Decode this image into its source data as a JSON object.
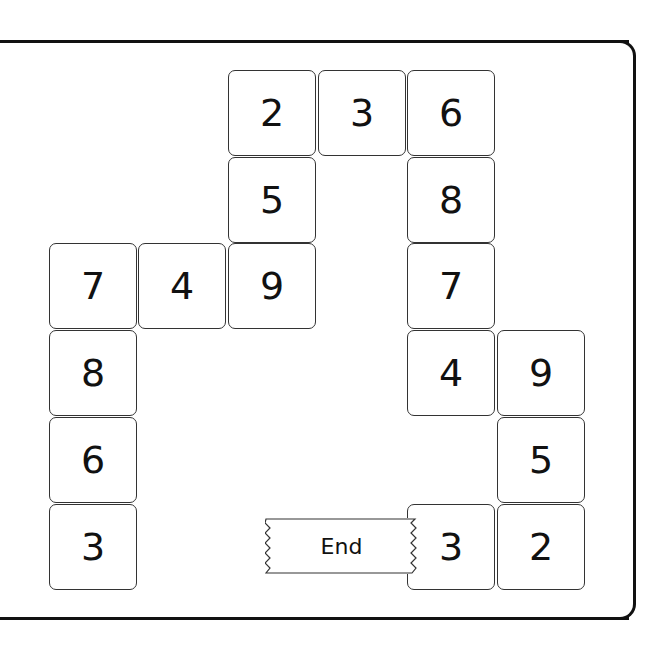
{
  "puzzle": {
    "type": "number-path",
    "end_label": "End",
    "cells": [
      {
        "value": "2",
        "col": 2,
        "row": 0
      },
      {
        "value": "3",
        "col": 3,
        "row": 0
      },
      {
        "value": "6",
        "col": 4,
        "row": 0
      },
      {
        "value": "5",
        "col": 2,
        "row": 1
      },
      {
        "value": "8",
        "col": 4,
        "row": 1
      },
      {
        "value": "7",
        "col": 0,
        "row": 2
      },
      {
        "value": "4",
        "col": 1,
        "row": 2
      },
      {
        "value": "9",
        "col": 2,
        "row": 2
      },
      {
        "value": "7",
        "col": 4,
        "row": 2
      },
      {
        "value": "8",
        "col": 0,
        "row": 3
      },
      {
        "value": "4",
        "col": 4,
        "row": 3
      },
      {
        "value": "9",
        "col": 5,
        "row": 3
      },
      {
        "value": "6",
        "col": 0,
        "row": 4
      },
      {
        "value": "5",
        "col": 5,
        "row": 4
      },
      {
        "value": "3",
        "col": 0,
        "row": 5
      },
      {
        "value": "3",
        "col": 4,
        "row": 5
      },
      {
        "value": "2",
        "col": 5,
        "row": 5
      }
    ]
  },
  "colors": {
    "border": "#111111",
    "cell_border": "#333333",
    "background": "#ffffff"
  }
}
